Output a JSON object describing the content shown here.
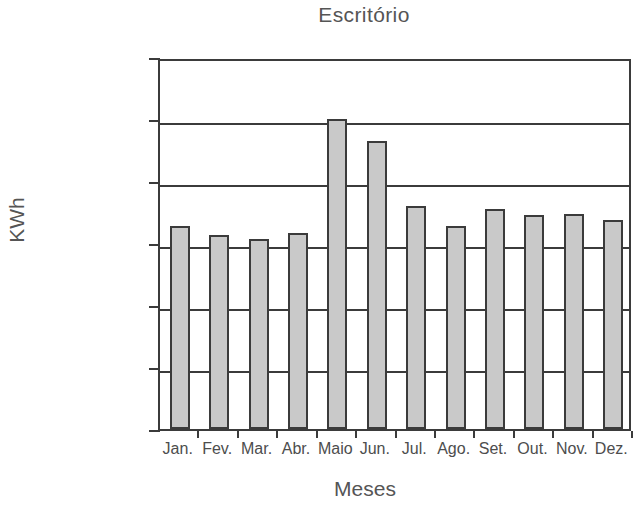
{
  "chart_data": {
    "type": "bar",
    "title": "Escritório",
    "xlabel": "Meses",
    "ylabel": "KWh",
    "categories": [
      "Jan.",
      "Fev.",
      "Mar.",
      "Abr.",
      "Maio",
      "Jun.",
      "Jul.",
      "Ago.",
      "Set.",
      "Out.",
      "Nov.",
      "Dez."
    ],
    "values": [
      655,
      625,
      613,
      632,
      1000,
      930,
      720,
      655,
      710,
      690,
      695,
      675
    ],
    "ylim": [
      0,
      1200
    ],
    "yticks": [
      0,
      200,
      400,
      600,
      800,
      1000,
      1200
    ],
    "ytick_labels": [
      "0",
      "200",
      "400",
      "600",
      "800",
      "1000",
      "1200"
    ],
    "grid": true,
    "legend": false,
    "series_name": "Escritório",
    "bar_fill_color": "#c9c9c9",
    "bar_border_color": "#3b3b3b",
    "axis_color": "#3b3b3b",
    "text_color": "#4d4d4d",
    "background_color": "#ffffff"
  }
}
